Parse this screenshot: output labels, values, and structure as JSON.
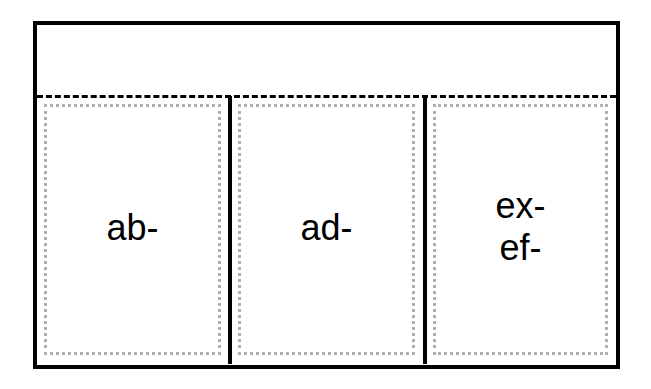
{
  "diagram": {
    "header": {
      "text": ""
    },
    "columns": [
      {
        "lines": [
          "ab-"
        ]
      },
      {
        "lines": [
          "ad-"
        ]
      },
      {
        "lines": [
          "ex-",
          "ef-"
        ]
      }
    ]
  },
  "colors": {
    "border": "#000000",
    "dotted": "#b0b0b0",
    "background": "#ffffff"
  }
}
